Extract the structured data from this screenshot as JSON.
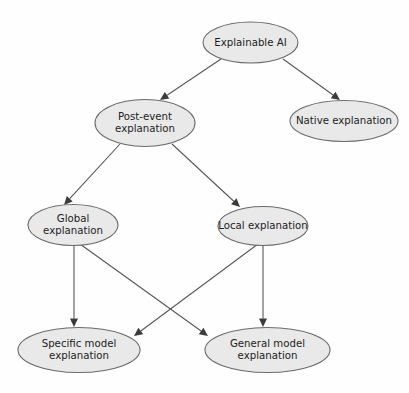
{
  "diagram": {
    "type": "tree-hierarchy-diagram",
    "background_color": "#fefefe",
    "node_fill_color": "#e9e9e9",
    "node_stroke_color": "#6b6b6b",
    "edge_color": "#585858",
    "text_color": "#1d1d1d",
    "nodes": [
      {
        "id": "explainable-ai",
        "label": "Explainable AI",
        "lines": [
          "Explainable AI"
        ],
        "cx": 250.5,
        "cy": 42.5,
        "rx": 47.5,
        "ry": 20.5,
        "level": 0
      },
      {
        "id": "post-event-explanation",
        "label": "Post-event explanation",
        "lines": [
          "Post-event",
          "explanation"
        ],
        "cx": 145.0,
        "cy": 123.0,
        "rx": 50.0,
        "ry": 23.5,
        "level": 1
      },
      {
        "id": "native-explanation",
        "label": "Native explanation",
        "lines": [
          "Native explanation"
        ],
        "cx": 344.0,
        "cy": 121.0,
        "rx": 54.0,
        "ry": 20.5,
        "level": 1
      },
      {
        "id": "global-explanation",
        "label": "Global explanation",
        "lines": [
          "Global",
          "explanation"
        ],
        "cx": 73.0,
        "cy": 225.0,
        "rx": 45.0,
        "ry": 20.5,
        "level": 2
      },
      {
        "id": "local-explanation",
        "label": "Local explanation",
        "lines": [
          "Local explanation"
        ],
        "cx": 263.0,
        "cy": 226.0,
        "rx": 45.0,
        "ry": 19.5,
        "level": 2
      },
      {
        "id": "specific-model-explanation",
        "label": "Specific model explanation",
        "lines": [
          "Specific model",
          "explanation"
        ],
        "cx": 79.0,
        "cy": 350.0,
        "rx": 61.0,
        "ry": 22.5,
        "level": 3
      },
      {
        "id": "general-model-explanation",
        "label": "General model explanation",
        "lines": [
          "General model",
          "explanation"
        ],
        "cx": 267.5,
        "cy": 350.0,
        "rx": 62.5,
        "ry": 22.5,
        "level": 3
      }
    ],
    "edges": [
      {
        "id": "edge-xai-to-post-event",
        "from": "explainable-ai",
        "to": "post-event-explanation",
        "x1": 221.0,
        "y1": 59.0,
        "x2": 160.0,
        "y2": 100.0,
        "arrow": true
      },
      {
        "id": "edge-xai-to-native",
        "from": "explainable-ai",
        "to": "native-explanation",
        "x1": 283.0,
        "y1": 59.0,
        "x2": 340.0,
        "y2": 100.0,
        "arrow": true
      },
      {
        "id": "edge-post-event-to-global",
        "from": "post-event-explanation",
        "to": "global-explanation",
        "x1": 120.0,
        "y1": 144.0,
        "x2": 64.0,
        "y2": 205.0,
        "arrow": true
      },
      {
        "id": "edge-post-event-to-local",
        "from": "post-event-explanation",
        "to": "local-explanation",
        "x1": 172.0,
        "y1": 144.0,
        "x2": 240.0,
        "y2": 207.0,
        "arrow": true
      },
      {
        "id": "edge-global-to-specific",
        "from": "global-explanation",
        "to": "specific-model-explanation",
        "x1": 74.0,
        "y1": 245.5,
        "x2": 74.0,
        "y2": 327.0,
        "arrow": true
      },
      {
        "id": "edge-global-to-general",
        "from": "global-explanation",
        "to": "general-model-explanation",
        "x1": 80.0,
        "y1": 244.0,
        "x2": 208.0,
        "y2": 336.0,
        "arrow": true
      },
      {
        "id": "edge-local-to-general",
        "from": "local-explanation",
        "to": "general-model-explanation",
        "x1": 263.0,
        "y1": 245.5,
        "x2": 263.0,
        "y2": 327.0,
        "arrow": true
      },
      {
        "id": "edge-local-to-specific",
        "from": "local-explanation",
        "to": "specific-model-explanation",
        "x1": 258.0,
        "y1": 244.0,
        "x2": 134.0,
        "y2": 336.0,
        "arrow": true
      }
    ]
  }
}
